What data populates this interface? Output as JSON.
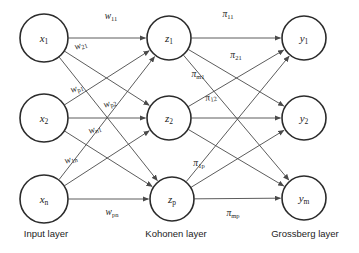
{
  "diagram": {
    "colors": {
      "node_stroke": "#2b2b2b",
      "edge_stroke": "#4a4a4a",
      "text": "#1c1c1c",
      "background": "#ffffff"
    }
  },
  "layers": [
    {
      "id": "input",
      "caption": "Input layer",
      "caption_x": 46,
      "caption_y": 234
    },
    {
      "id": "kohonen",
      "caption": "Kohonen layer",
      "caption_x": 176,
      "caption_y": 234
    },
    {
      "id": "grossberg",
      "caption": "Grossberg layer",
      "caption_x": 305,
      "caption_y": 234
    }
  ],
  "nodes": [
    {
      "id": "x1",
      "layer": "input",
      "base": "x",
      "sub": "1",
      "cx": 44,
      "cy": 38,
      "r": 24
    },
    {
      "id": "x2",
      "layer": "input",
      "base": "x",
      "sub": "2",
      "cx": 44,
      "cy": 118,
      "r": 24
    },
    {
      "id": "xn",
      "layer": "input",
      "base": "x",
      "sub": "n",
      "cx": 44,
      "cy": 199,
      "r": 24
    },
    {
      "id": "z1",
      "layer": "kohonen",
      "base": "z",
      "sub": "1",
      "cx": 169,
      "cy": 38,
      "r": 22
    },
    {
      "id": "z2",
      "layer": "kohonen",
      "base": "z",
      "sub": "2",
      "cx": 169,
      "cy": 118,
      "r": 22
    },
    {
      "id": "zp",
      "layer": "kohonen",
      "base": "z",
      "sub": "p",
      "cx": 172,
      "cy": 199,
      "r": 22
    },
    {
      "id": "y1",
      "layer": "grossberg",
      "base": "y",
      "sub": "1",
      "cx": 304,
      "cy": 38,
      "r": 22
    },
    {
      "id": "y2",
      "layer": "grossberg",
      "base": "y",
      "sub": "2",
      "cx": 304,
      "cy": 118,
      "r": 22
    },
    {
      "id": "ym",
      "layer": "grossberg",
      "base": "y",
      "sub": "m",
      "cx": 304,
      "cy": 198,
      "r": 22
    }
  ],
  "edges": [
    {
      "from": "x1",
      "to": "z1"
    },
    {
      "from": "x1",
      "to": "z2"
    },
    {
      "from": "x1",
      "to": "zp"
    },
    {
      "from": "x2",
      "to": "z1"
    },
    {
      "from": "x2",
      "to": "z2"
    },
    {
      "from": "x2",
      "to": "zp"
    },
    {
      "from": "xn",
      "to": "z1"
    },
    {
      "from": "xn",
      "to": "z2"
    },
    {
      "from": "xn",
      "to": "zp"
    },
    {
      "from": "z1",
      "to": "y1"
    },
    {
      "from": "z1",
      "to": "y2"
    },
    {
      "from": "z1",
      "to": "ym"
    },
    {
      "from": "z2",
      "to": "y1"
    },
    {
      "from": "z2",
      "to": "y2"
    },
    {
      "from": "z2",
      "to": "ym"
    },
    {
      "from": "zp",
      "to": "y1"
    },
    {
      "from": "zp",
      "to": "y2"
    },
    {
      "from": "zp",
      "to": "ym"
    }
  ],
  "weight_labels": [
    {
      "id": "w11",
      "base": "w",
      "sub": "11",
      "x": 111,
      "y": 17,
      "rotate": 0
    },
    {
      "id": "w21",
      "base": "w",
      "sub": "21",
      "x": 81,
      "y": 46,
      "rotate": -17
    },
    {
      "id": "wp1",
      "base": "w",
      "sub": "p1",
      "x": 77,
      "y": 89,
      "rotate": -17
    },
    {
      "id": "wp2",
      "base": "w",
      "sub": "p2",
      "x": 110,
      "y": 104,
      "rotate": -17
    },
    {
      "id": "wn1",
      "base": "w",
      "sub": "n1",
      "x": 95,
      "y": 130,
      "rotate": -17
    },
    {
      "id": "w1n",
      "base": "w",
      "sub": "1n",
      "x": 71,
      "y": 160,
      "rotate": -17
    },
    {
      "id": "wpn",
      "base": "w",
      "sub": "pn",
      "x": 112,
      "y": 213,
      "rotate": 0
    },
    {
      "id": "pi11",
      "base": "π",
      "sub": "11",
      "x": 228,
      "y": 15,
      "rotate": 0
    },
    {
      "id": "pi21",
      "base": "π",
      "sub": "21",
      "x": 236,
      "y": 56,
      "rotate": 0
    },
    {
      "id": "pim1",
      "base": "π",
      "sub": "m1",
      "x": 198,
      "y": 75,
      "rotate": 0
    },
    {
      "id": "pi12",
      "base": "π",
      "sub": "12",
      "x": 211,
      "y": 98,
      "rotate": -10
    },
    {
      "id": "pi1p",
      "base": "π",
      "sub": "1p",
      "x": 199,
      "y": 164,
      "rotate": 0
    },
    {
      "id": "pimp",
      "base": "π",
      "sub": "mp",
      "x": 233,
      "y": 214,
      "rotate": 0
    }
  ]
}
